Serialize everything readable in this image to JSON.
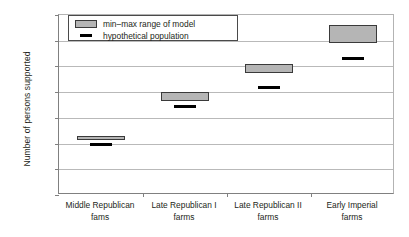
{
  "chart_data": {
    "type": "bar",
    "title": "",
    "subtitle": "",
    "xlabel": "",
    "ylabel": "Number of persons supported",
    "ylim": [
      0,
      140
    ],
    "yticks": [
      0,
      20,
      40,
      60,
      80,
      100,
      120,
      140
    ],
    "grid": "horizontal",
    "legend_position": "top-left-inside",
    "categories": [
      "Middle Republican fams",
      "Late Republican I farms",
      "Late Republican II farms",
      "Early Imperial farms"
    ],
    "category_lines": [
      {
        "line1": "Middle Republican",
        "line2": "fams"
      },
      {
        "line1": "Late Republican I",
        "line2": "farms"
      },
      {
        "line1": "Late Republican II",
        "line2": "farms"
      },
      {
        "line1": "Early Imperial",
        "line2": "farms"
      }
    ],
    "series": [
      {
        "name": "min–max range of model",
        "type": "range-box",
        "min": [
          43,
          73,
          95,
          118
        ],
        "max": [
          46,
          80,
          102,
          132
        ],
        "color": "#b5b5b5"
      },
      {
        "name": "hypothetical population",
        "type": "marker-line",
        "values": [
          39,
          69,
          84,
          106
        ],
        "color": "#000000"
      }
    ]
  },
  "legend": {
    "entries": [
      {
        "label": "min–max range of model",
        "key": "swatch"
      },
      {
        "label": "hypothetical population",
        "key": "dash"
      }
    ]
  },
  "colors": {
    "box_fill": "#b5b5b5",
    "box_border": "#3a3a3a",
    "marker": "#000000",
    "gridline": "#b9b9b9",
    "axis": "#808080",
    "text": "#231f20",
    "background": "#ffffff"
  }
}
